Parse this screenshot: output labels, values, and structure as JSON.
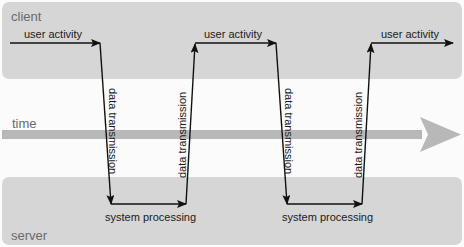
{
  "lanes": {
    "client": "client",
    "time": "time",
    "server": "server"
  },
  "labels": {
    "user_activity_1": "user activity",
    "user_activity_2": "user activity",
    "user_activity_3": "user activity",
    "data_transmission_1": "data transmission",
    "data_transmission_2": "data transmission",
    "data_transmission_3": "data transmission",
    "data_transmission_4": "data transmission",
    "system_processing_1": "system processing",
    "system_processing_2": "system processing"
  },
  "colors": {
    "lane_fill": "#d6d6d6",
    "time_arrow": "#b5b5b5",
    "flow_line": "#111111"
  }
}
